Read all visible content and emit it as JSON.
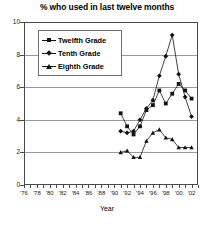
{
  "chart_data": {
    "type": "line",
    "title": "% who used in last twelve months",
    "xlabel": "Year",
    "ylabel": "",
    "ylim": [
      0,
      10
    ],
    "yticks": [
      0,
      2,
      4,
      6,
      8,
      10
    ],
    "xlim": [
      1976,
      2003
    ],
    "xticks": [
      1976,
      1978,
      1980,
      1982,
      1984,
      1986,
      1988,
      1990,
      1992,
      1994,
      1996,
      1998,
      2000,
      2002
    ],
    "xticklabels": [
      "'76",
      "'78",
      "'80",
      "'82",
      "'84",
      "'86",
      "'88",
      "'90",
      "'92",
      "'94",
      "'96",
      "'98",
      "'00",
      "'02"
    ],
    "grid": true,
    "legend_position": "upper left",
    "series": [
      {
        "name": "Twelfth Grade",
        "marker": "square",
        "x": [
          1991,
          1992,
          1993,
          1994,
          1995,
          1996,
          1997,
          1998,
          1999,
          2000,
          2001,
          2002
        ],
        "values": [
          4.4,
          3.6,
          3.1,
          3.6,
          4.6,
          4.9,
          5.8,
          5.0,
          5.6,
          6.2,
          5.8,
          5.3
        ]
      },
      {
        "name": "Tenth Grade",
        "marker": "diamond",
        "x": [
          1991,
          1992,
          1993,
          1994,
          1995,
          1996,
          1997,
          1998,
          1999,
          2000,
          2001,
          2002
        ],
        "values": [
          3.3,
          3.2,
          3.3,
          4.0,
          4.7,
          5.2,
          6.7,
          7.9,
          9.2,
          6.8,
          5.4,
          4.2
        ]
      },
      {
        "name": "Eighth Grade",
        "marker": "triangle",
        "x": [
          1991,
          1992,
          1993,
          1994,
          1995,
          1996,
          1997,
          1998,
          1999,
          2000,
          2001,
          2002
        ],
        "values": [
          2.0,
          2.1,
          1.7,
          1.7,
          2.7,
          3.2,
          3.4,
          2.9,
          2.8,
          2.3,
          2.3,
          2.3
        ]
      }
    ]
  },
  "legend": {
    "items": [
      {
        "label": "Twelfth Grade"
      },
      {
        "label": "Tenth Grade"
      },
      {
        "label": "Eighth Grade"
      }
    ]
  }
}
